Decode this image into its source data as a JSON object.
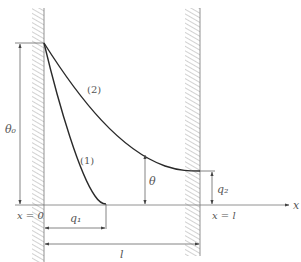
{
  "diagram": {
    "type": "temperature distribution along a fin/rod between two walls",
    "labels": {
      "theta0": "θ₀",
      "theta": "θ",
      "curve1": "(1)",
      "curve2": "(2)",
      "q1": "q₁",
      "q2": "q₂",
      "length": "l",
      "x_axis": "x",
      "x_start": "x = 0",
      "x_end": "x = l"
    },
    "colors": {
      "curve": "#2a2a2a",
      "lines": "#666666",
      "hatch": "#999999",
      "text": "#555555"
    }
  }
}
